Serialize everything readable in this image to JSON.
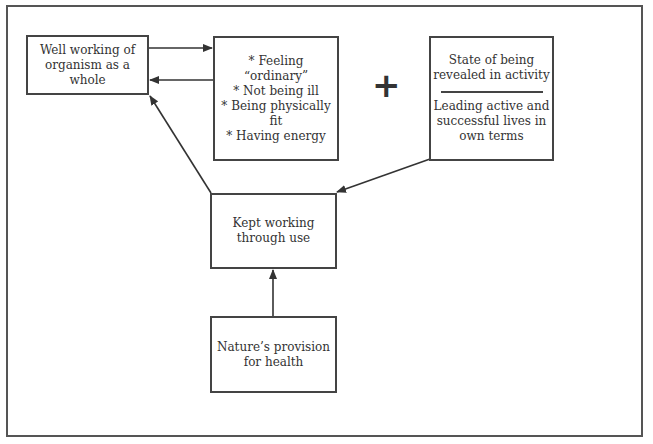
{
  "diagram": {
    "nodes": {
      "well_working": {
        "label": "Well working of\norganism as a whole"
      },
      "feelings": {
        "lines": [
          "* Feeling “ordinary”",
          "* Not being ill",
          "* Being physically fit",
          "* Having energy"
        ]
      },
      "state_of_being": {
        "top": "State of being\nrevealed in activity",
        "bottom": "Leading active and\nsuccessful lives in\nown terms"
      },
      "kept_working": {
        "label": "Kept working\nthrough use"
      },
      "natures_provision": {
        "label": "Nature’s provision\nfor health"
      }
    },
    "plus_symbol": "+",
    "edges": [
      {
        "from": "well_working",
        "to": "feelings"
      },
      {
        "from": "feelings",
        "to": "well_working"
      },
      {
        "from": "kept_working",
        "to": "well_working"
      },
      {
        "from": "state_of_being",
        "to": "kept_working"
      },
      {
        "from": "natures_provision",
        "to": "kept_working"
      }
    ]
  }
}
